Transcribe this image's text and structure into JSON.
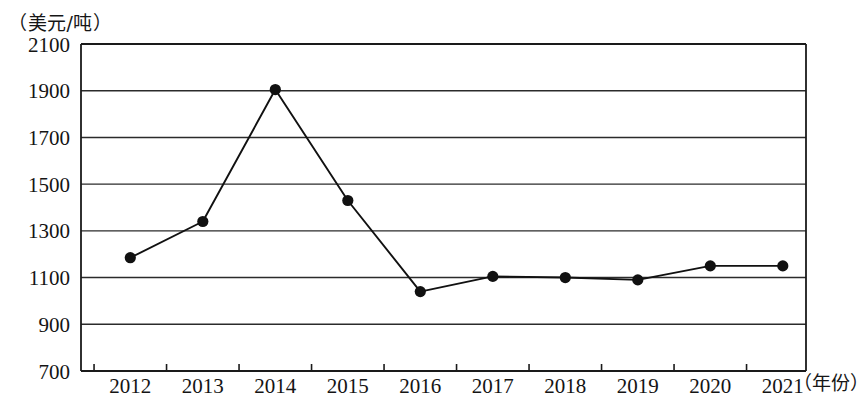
{
  "chart_data": {
    "type": "line",
    "title": "",
    "subtitle": "",
    "xlabel": "（年份）",
    "ylabel": "（美元/吨）",
    "categories": [
      "2012",
      "2013",
      "2014",
      "2015",
      "2016",
      "2017",
      "2018",
      "2019",
      "2020",
      "2021"
    ],
    "x": [
      2012,
      2013,
      2014,
      2015,
      2016,
      2017,
      2018,
      2019,
      2020,
      2021
    ],
    "values": [
      1185,
      1340,
      1905,
      1430,
      1040,
      1105,
      1100,
      1090,
      1150,
      1150
    ],
    "series": [
      {
        "name": "价格",
        "values": [
          1185,
          1340,
          1905,
          1430,
          1040,
          1105,
          1100,
          1090,
          1150,
          1150
        ]
      }
    ],
    "ylim": [
      700,
      2100
    ],
    "yticks": [
      700,
      900,
      1100,
      1300,
      1500,
      1700,
      1900,
      2100
    ],
    "ytick_labels": [
      "700",
      "900",
      "1100",
      "1300",
      "1500",
      "1700",
      "1900",
      "2100"
    ],
    "xtick_labels": [
      "2012",
      "2013",
      "2014",
      "2015",
      "2016",
      "2017",
      "2018",
      "2019",
      "2020",
      "2021"
    ],
    "grid": true,
    "grid_axis": "y",
    "legend": false,
    "legend_position": "none",
    "marker": "circle",
    "marker_color": "#111111",
    "line_color": "#111111",
    "annotations": []
  },
  "labels": {
    "unit": "（美元/吨）",
    "year": "（年份）"
  },
  "colors": {
    "line": "#111111",
    "marker": "#111111",
    "grid": "#2b2b2b",
    "axis": "#1a1a1a",
    "background": "#ffffff"
  }
}
